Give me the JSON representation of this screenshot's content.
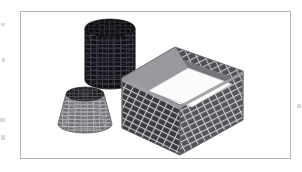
{
  "figure": {
    "caption": "",
    "background_color": "#ffffff",
    "frame": {
      "name": "figure-border",
      "x": 20,
      "y": 11,
      "width": 270,
      "height": 147,
      "stroke_color": "#b4b4b4",
      "stroke_width": 1,
      "fill_color": "#ffffff"
    },
    "scene": {
      "type": "3d-mesh-solids",
      "projection": "isometric",
      "object_count": 3,
      "objects": [
        {
          "name": "cylinder",
          "label": "cylinder",
          "shape": "cylinder",
          "shading": "very-dark",
          "fill_color": "#0d0d10",
          "side_color": "#111114",
          "top_color": "#08080a",
          "mesh_color": "#4a4a55",
          "mesh_rings": 12,
          "mesh_columns": 16,
          "center_x": 110,
          "top_center_y": 28,
          "radius_x": 25,
          "radius_y": 9,
          "height": 52
        },
        {
          "name": "cone-frustum",
          "label": "truncated cone",
          "shape": "frustum",
          "shading": "mid-dark",
          "fill_color": "#6e6e72",
          "side_color": "#76767a",
          "top_color": "#17171a",
          "mesh_color": "#b9b9be",
          "mesh_rings": 11,
          "mesh_columns": 16,
          "center_x": 85,
          "top_center_y": 94,
          "top_radius_x": 19,
          "top_radius_y": 7,
          "bottom_radius_x": 27,
          "bottom_radius_y": 9,
          "height": 37
        },
        {
          "name": "open-box",
          "label": "open rectangular box",
          "shape": "box-open-top",
          "shading": "gray-grid",
          "wall_color_back_left": "#6a6a6e",
          "wall_color_back_right": "#4f4f53",
          "wall_color_front_left": "#3c3c40",
          "wall_color_front_right": "#545458",
          "rim_color": "#9a9a9e",
          "interior_color": "#fbfbfb",
          "mesh_color": "#d2d2d6",
          "mesh_rows": 14,
          "mesh_columns": 18
        }
      ]
    },
    "scan_artifacts": {
      "name": "page-scan-specks",
      "color": "#d9d9d9",
      "specks": [
        {
          "x": 1,
          "y": 23,
          "w": 4,
          "h": 3
        },
        {
          "x": 2,
          "y": 58,
          "w": 3,
          "h": 4
        },
        {
          "x": 0,
          "y": 118,
          "w": 5,
          "h": 4
        },
        {
          "x": 1,
          "y": 135,
          "w": 4,
          "h": 5
        },
        {
          "x": 297,
          "y": 104,
          "w": 4,
          "h": 4
        }
      ]
    }
  }
}
